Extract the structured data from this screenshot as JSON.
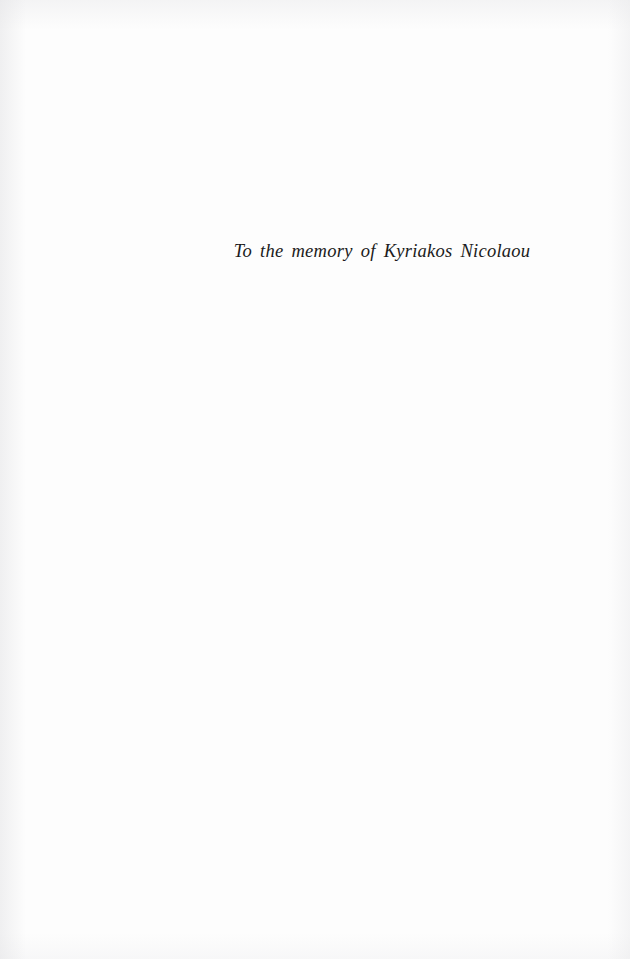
{
  "page": {
    "kind": "book-dedication-page",
    "background_color": "#fdfdfd",
    "width": 630,
    "height": 959
  },
  "dedication": {
    "text": "To the memory of Kyriakos Nicolaou",
    "style": "italic",
    "text_color": "#1b1b20",
    "alignment": "center"
  }
}
